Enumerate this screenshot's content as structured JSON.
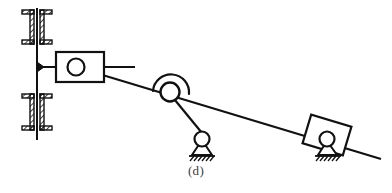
{
  "figure": {
    "caption": "(d)",
    "type": "kinematic-linkage-diagram",
    "stroke_color": "#111111",
    "fill_color": "#ffffff",
    "background_color": "#ffffff",
    "hatch_color": "#111111",
    "components": [
      {
        "id": "fixed-frame",
        "label": "fixed frame guide",
        "kind": "ground-rail",
        "rail_x": 37,
        "rail_top": 8,
        "rail_bottom": 140
      },
      {
        "id": "upper-ground-bracket",
        "label": "upper hatched ground bracket",
        "kind": "hatched-bracket"
      },
      {
        "id": "lower-ground-bracket",
        "label": "lower hatched ground bracket",
        "kind": "hatched-bracket"
      },
      {
        "id": "guide-arrow",
        "label": "guide connection wedge",
        "kind": "arrow-wedge"
      },
      {
        "id": "slider-block-left",
        "label": "left slider block",
        "kind": "rectangular-slider",
        "center_x": 80,
        "center_y": 67
      },
      {
        "id": "pin-joint-left",
        "label": "left slider pin joint",
        "kind": "revolute-joint",
        "cx": 76,
        "cy": 67,
        "r": 8
      },
      {
        "id": "slider-stub-link",
        "label": "horizontal stub link",
        "kind": "link-line"
      },
      {
        "id": "coupler-link",
        "label": "long diagonal coupler link",
        "kind": "link-line"
      },
      {
        "id": "pivot-joint-middle",
        "label": "middle pivot joint with collar",
        "kind": "revolute-joint-collar",
        "cx": 170,
        "cy": 92,
        "r": 9
      },
      {
        "id": "rocker-link",
        "label": "rocker link to ground pin",
        "kind": "link-line"
      },
      {
        "id": "ground-pin-support",
        "label": "grounded pin support",
        "kind": "pin-support",
        "cx": 202,
        "cy": 140
      },
      {
        "id": "slider-block-right",
        "label": "right inclined slider block",
        "kind": "inclined-slider",
        "center_x": 327,
        "center_y": 140
      },
      {
        "id": "ground-slider-support",
        "label": "grounded support under right slider",
        "kind": "pin-support",
        "cx": 327,
        "cy": 142
      }
    ]
  }
}
